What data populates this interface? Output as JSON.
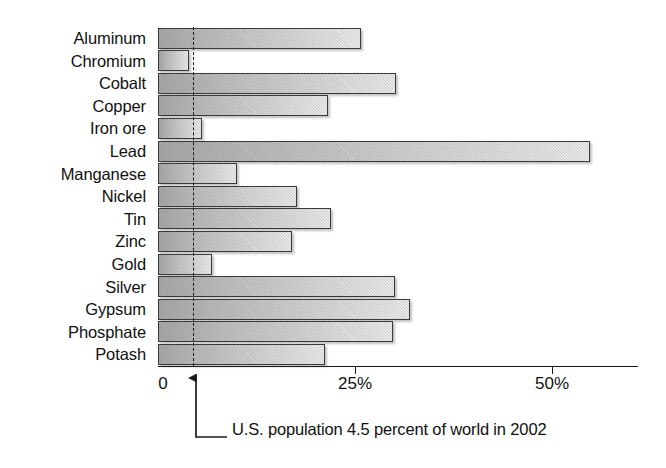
{
  "chart_data": {
    "type": "bar",
    "orientation": "horizontal",
    "title": "",
    "subtitle": "",
    "xlabel": "",
    "ylabel": "",
    "xlim": [
      0,
      60
    ],
    "grid": false,
    "legend": null,
    "categories": [
      "Aluminum",
      "Chromium",
      "Cobalt",
      "Copper",
      "Iron ore",
      "Lead",
      "Manganese",
      "Nickel",
      "Tin",
      "Zinc",
      "Gold",
      "Silver",
      "Gypsum",
      "Phosphate",
      "Potash"
    ],
    "values": [
      25.8,
      3.9,
      30.2,
      21.6,
      5.6,
      54.8,
      10.0,
      17.6,
      22.0,
      17.0,
      6.8,
      30.1,
      32.0,
      29.8,
      21.2
    ],
    "xticks": [
      0,
      25,
      50
    ],
    "xtick_labels": [
      "0",
      "25%",
      "50%"
    ],
    "reference_line": {
      "value": 4.5,
      "style": "dashed",
      "label": "U.S. population 4.5 percent of world in 2002"
    },
    "annotation": "U.S. population 4.5 percent of world in 2002",
    "colors": {
      "bar_fill_dark": "#a5a5a5",
      "bar_fill_light": "#e9e9e9",
      "bar_border": "#3a3a3a",
      "axis": "#1a1a1a",
      "text": "#111111",
      "background": "#ffffff"
    }
  }
}
